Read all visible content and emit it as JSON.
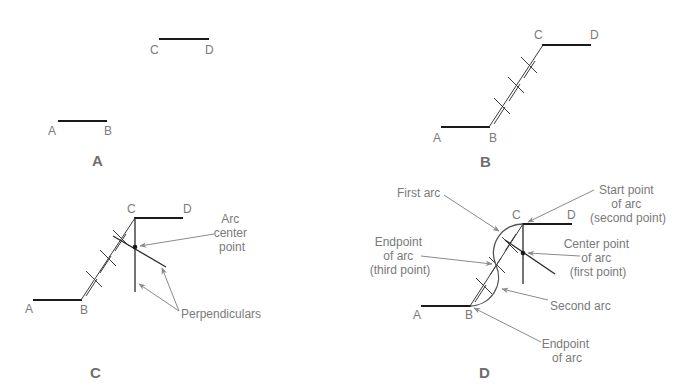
{
  "panels": {
    "a": {
      "caption": "A",
      "points": {
        "A": "A",
        "B": "B",
        "C": "C",
        "D": "D"
      }
    },
    "b": {
      "caption": "B",
      "points": {
        "A": "A",
        "B": "B",
        "C": "C",
        "D": "D"
      }
    },
    "c": {
      "caption": "C",
      "points": {
        "A": "A",
        "B": "B",
        "C": "C",
        "D": "D"
      },
      "callouts": {
        "arc_center": [
          "Arc",
          "center",
          "point"
        ],
        "perpendiculars": "Perpendiculars"
      }
    },
    "d": {
      "caption": "D",
      "points": {
        "A": "A",
        "B": "B",
        "C": "C",
        "D": "D"
      },
      "callouts": {
        "first_arc": "First arc",
        "start_point": [
          "Start point",
          "of arc",
          "(second point)"
        ],
        "endpoint_third": [
          "Endpoint",
          "of arc",
          "(third point)"
        ],
        "center_point": [
          "Center point",
          "of arc",
          "(first point)"
        ],
        "second_arc": "Second arc",
        "endpoint_arc": [
          "Endpoint",
          "of arc"
        ]
      }
    }
  },
  "colors": {
    "line": "#1a1a1a",
    "label": "#7a7a7a",
    "leader": "#8a8a8a",
    "caption": "#6e6e6e"
  }
}
